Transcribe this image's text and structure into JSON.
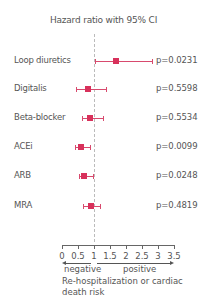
{
  "chart_data": {
    "type": "forest",
    "title": "Hazard ratio with 95% CI",
    "xlabel": "Re-hospitalization or cardiac death risk",
    "xlim": [
      0,
      3.5
    ],
    "xticks": [
      0,
      0.5,
      1,
      1.5,
      2,
      2.5,
      3,
      3.5
    ],
    "xtick_labels": [
      "0",
      "0.5",
      "1",
      "1.5",
      "2",
      "2.5",
      "3",
      "3.5"
    ],
    "reference_line": 1,
    "direction_labels": {
      "left": "negative",
      "right": "positive"
    },
    "categories": [
      "Loop diuretics",
      "Digitalis",
      "Beta-blocker",
      "ACEi",
      "ARB",
      "MRA"
    ],
    "series": [
      {
        "name": "Hazard ratio",
        "values": [
          1.69,
          0.81,
          0.88,
          0.59,
          0.69,
          0.91
        ]
      },
      {
        "name": "CI lower",
        "values": [
          1.03,
          0.44,
          0.63,
          0.41,
          0.53,
          0.66
        ]
      },
      {
        "name": "CI upper",
        "values": [
          2.81,
          1.38,
          1.28,
          0.88,
          0.97,
          1.19
        ]
      }
    ],
    "p_values": [
      "p=0.0231",
      "p=0.5598",
      "p=0.5534",
      "p=0.0099",
      "p=0.0248",
      "p=0.4819"
    ],
    "marker_color": "#d8315b",
    "grid": false
  },
  "rows": [
    {
      "label": "Loop diuretics",
      "p": "p=0.0231"
    },
    {
      "label": "Digitalis",
      "p": "p=0.5598"
    },
    {
      "label": "Beta-blocker",
      "p": "p=0.5534"
    },
    {
      "label": "ACEi",
      "p": "p=0.0099"
    },
    {
      "label": "ARB",
      "p": "p=0.0248"
    },
    {
      "label": "MRA",
      "p": "p=0.4819"
    }
  ],
  "axis": {
    "ticks": [
      "0",
      "0.5",
      "1",
      "1.5",
      "2",
      "2.5",
      "3",
      "3.5"
    ],
    "negative": "negative",
    "positive": "positive",
    "xlabel": "Re-hospitalization or cardiac death risk"
  },
  "title": "Hazard ratio with 95% CI"
}
